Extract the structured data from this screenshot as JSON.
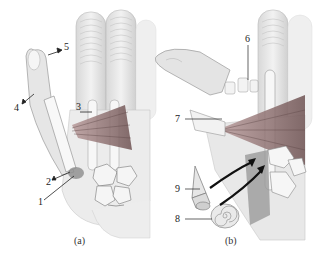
{
  "figure": {
    "panels": [
      {
        "id": "a",
        "caption": "(a)",
        "labels": [
          {
            "num": "1",
            "x": 38,
            "y": 203
          },
          {
            "num": "2",
            "x": 48,
            "y": 183
          },
          {
            "num": "3",
            "x": 77,
            "y": 104
          },
          {
            "num": "4",
            "x": 16,
            "y": 107
          },
          {
            "num": "5",
            "x": 65,
            "y": 44
          }
        ]
      },
      {
        "id": "b",
        "caption": "(b)",
        "labels": [
          {
            "num": "6",
            "x": 245,
            "y": 36
          },
          {
            "num": "7",
            "x": 175,
            "y": 117
          },
          {
            "num": "8",
            "x": 175,
            "y": 215
          },
          {
            "num": "9",
            "x": 175,
            "y": 185
          }
        ]
      }
    ]
  },
  "colors": {
    "skin": "#e9e9e9",
    "outline": "#9a9a9a",
    "bone": "#f4f4f4",
    "muscle": "#8a6a6a",
    "arrow": "#111111",
    "shadow": "#bdbdbd"
  }
}
